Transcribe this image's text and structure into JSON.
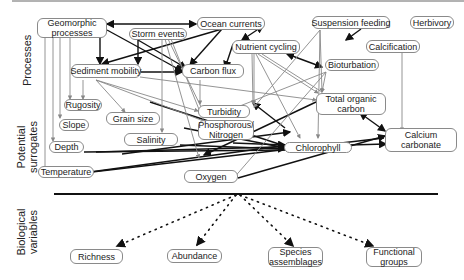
{
  "section_labels": {
    "processes": "Processes",
    "surrogates_line1": "Potential",
    "surrogates_line2": "surrogates",
    "bio_line1": "Biological",
    "bio_line2": "variables"
  },
  "nodes": {
    "geomorphic": "Geomorphic processes",
    "ocean": "Ocean currents",
    "storm": "Storm events",
    "suspension": "Suspension feeding",
    "herbivory": "Herbivory",
    "nutrient": "Nutrient cycling",
    "calcification": "Calcification",
    "bioturbation": "Bioturbation",
    "sediment": "Sediment mobility",
    "carbon_flux": "Carbon flux",
    "rugosity": "Rugosity",
    "toc": "Total organic carbon",
    "grain": "Grain size",
    "turbidity": "Turbidity",
    "slope": "Slope",
    "phos": "Phosphorous/ Nitrogen",
    "salinity": "Salinity",
    "calcium": "Calcium carbonate",
    "depth": "Depth",
    "chlorophyll": "Chlorophyll",
    "temperature": "Temperature",
    "oxygen": "Oxygen",
    "richness": "Richness",
    "abundance": "Abundance",
    "species": "Species assemblages",
    "functional": "Functional groups"
  }
}
